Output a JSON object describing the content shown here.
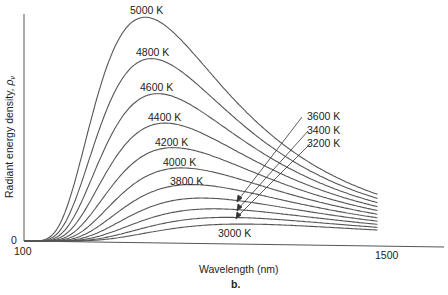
{
  "chart_data": {
    "type": "line",
    "title": "",
    "figure_label": "b.",
    "xlabel": "Wavelength (nm)",
    "ylabel": "Radiant energy density, ρν",
    "ylabel_main": "Radiant energy density, ",
    "ylabel_symbol": "ρ",
    "ylabel_subscript": "ν",
    "x_ticks": [
      "100",
      "1500"
    ],
    "y_ticks": [
      "0"
    ],
    "xlim": [
      100,
      1500
    ],
    "grid": false,
    "legend": "inline labels",
    "series": [
      {
        "name": "5000 K",
        "temperature": 5000,
        "peak_nm": 580
      },
      {
        "name": "4800 K",
        "temperature": 4800,
        "peak_nm": 604
      },
      {
        "name": "4600 K",
        "temperature": 4600,
        "peak_nm": 630
      },
      {
        "name": "4400 K",
        "temperature": 4400,
        "peak_nm": 659
      },
      {
        "name": "4200 K",
        "temperature": 4200,
        "peak_nm": 690
      },
      {
        "name": "4000 K",
        "temperature": 4000,
        "peak_nm": 724
      },
      {
        "name": "3800 K",
        "temperature": 3800,
        "peak_nm": 763
      },
      {
        "name": "3600 K",
        "temperature": 3600,
        "peak_nm": 805
      },
      {
        "name": "3400 K",
        "temperature": 3400,
        "peak_nm": 852
      },
      {
        "name": "3200 K",
        "temperature": 3200,
        "peak_nm": 906
      },
      {
        "name": "3000 K",
        "temperature": 3000,
        "peak_nm": 966
      }
    ],
    "annotations": [
      {
        "text": "3600 K",
        "arrow": true
      },
      {
        "text": "3400 K",
        "arrow": true
      },
      {
        "text": "3200 K",
        "arrow": true
      }
    ]
  },
  "labels": {
    "t5000": "5000 K",
    "t4800": "4800 K",
    "t4600": "4600 K",
    "t4400": "4400 K",
    "t4200": "4200 K",
    "t4000": "4000 K",
    "t3800": "3800 K",
    "t3600": "3600 K",
    "t3400": "3400 K",
    "t3200": "3200 K",
    "t3000": "3000 K"
  },
  "colors": {
    "curve": "#555555",
    "axis": "#555555",
    "text": "#222222"
  }
}
